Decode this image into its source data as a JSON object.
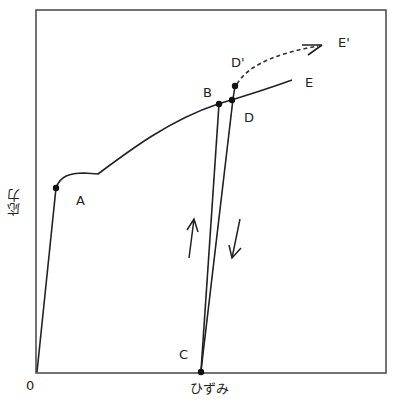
{
  "axes": {
    "x_label": "ひずみ",
    "y_label": "応力",
    "origin_label": "0"
  },
  "points": {
    "A": "A",
    "B": "B",
    "C": "C",
    "D": "D",
    "D_prime": "D'",
    "E": "E",
    "E_prime": "E'"
  },
  "colors": {
    "line": "#222222",
    "frame": "#444444"
  }
}
